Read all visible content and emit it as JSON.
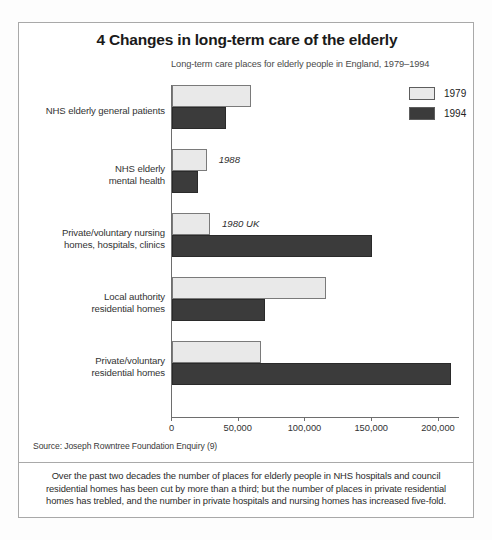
{
  "figure": {
    "title": "4 Changes in long-term care of the elderly",
    "subtitle": "Long-term care places for elderly people in England, 1979–1994",
    "source": "Source: Joseph Rowntree Foundation Enquiry (9)",
    "footnote": "Over the past two decades the number of places for elderly people in NHS hospitals and council residential homes has been cut by more than a third; but the number of places in private residential homes has trebled, and the number in private hospitals and nursing homes has increased five-fold."
  },
  "legend": {
    "position": "top-right",
    "entries": [
      {
        "label": "1979",
        "color": "#e9e9e9"
      },
      {
        "label": "1994",
        "color": "#3b3b3b"
      }
    ]
  },
  "chart_data": {
    "type": "bar",
    "orientation": "horizontal",
    "title": "Long-term care places for elderly people in England, 1979–1994",
    "xlabel": "",
    "ylabel": "",
    "xlim": [
      0,
      215000
    ],
    "grid": false,
    "legend_position": "top-right",
    "xticks": [
      0,
      50000,
      100000,
      150000,
      200000
    ],
    "xticklabels": [
      "0",
      "50,000",
      "100,000",
      "150,000",
      "200,000"
    ],
    "categories": [
      "NHS elderly general patients",
      "NHS elderly\nmental health",
      "Private/voluntary nursing\nhomes, hospitals, clinics",
      "Local authority\nresidential homes",
      "Private/voluntary\nresidential homes"
    ],
    "series": [
      {
        "name": "1979",
        "color": "#e9e9e9",
        "values": [
          59000,
          26000,
          28500,
          115000,
          67000
        ]
      },
      {
        "name": "1994",
        "color": "#3b3b3b",
        "values": [
          40500,
          19500,
          150000,
          70000,
          209000
        ]
      }
    ],
    "annotations": [
      {
        "text": "1988",
        "category_index": 1,
        "series": "1979"
      },
      {
        "text": "1980 UK",
        "category_index": 2,
        "series": "1979"
      }
    ]
  },
  "categories_display": [
    {
      "line1": "NHS elderly general patients",
      "line2": ""
    },
    {
      "line1": "NHS elderly",
      "line2": "mental health"
    },
    {
      "line1": "Private/voluntary nursing",
      "line2": "homes, hospitals, clinics"
    },
    {
      "line1": "Local authority",
      "line2": "residential homes"
    },
    {
      "line1": "Private/voluntary",
      "line2": "residential homes"
    }
  ]
}
